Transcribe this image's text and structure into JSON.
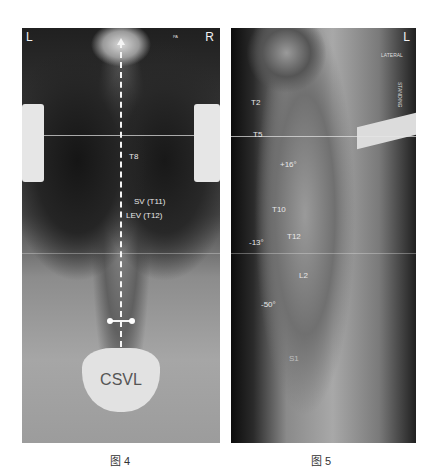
{
  "figures": [
    {
      "caption": "图 4",
      "view": "PA",
      "corner_left": "L",
      "corner_right": "R",
      "corner_tag": "PA",
      "labels": {
        "t8": "T8",
        "sv": "SV (T11)",
        "lev": "LEV (T12)",
        "csvl": "CSVL"
      }
    },
    {
      "caption": "图 5",
      "view": "LATERAL",
      "corner_right": "L",
      "view_tag": "LATERAL",
      "side_tag": "STANDING",
      "labels": {
        "t2": "T2",
        "t5": "T5",
        "kyphosis_angle": "+16°",
        "t10": "T10",
        "tl_angle": "-13°",
        "t12": "T12",
        "l2": "L2",
        "lordosis_angle": "-50°",
        "s1": "S1"
      }
    }
  ]
}
